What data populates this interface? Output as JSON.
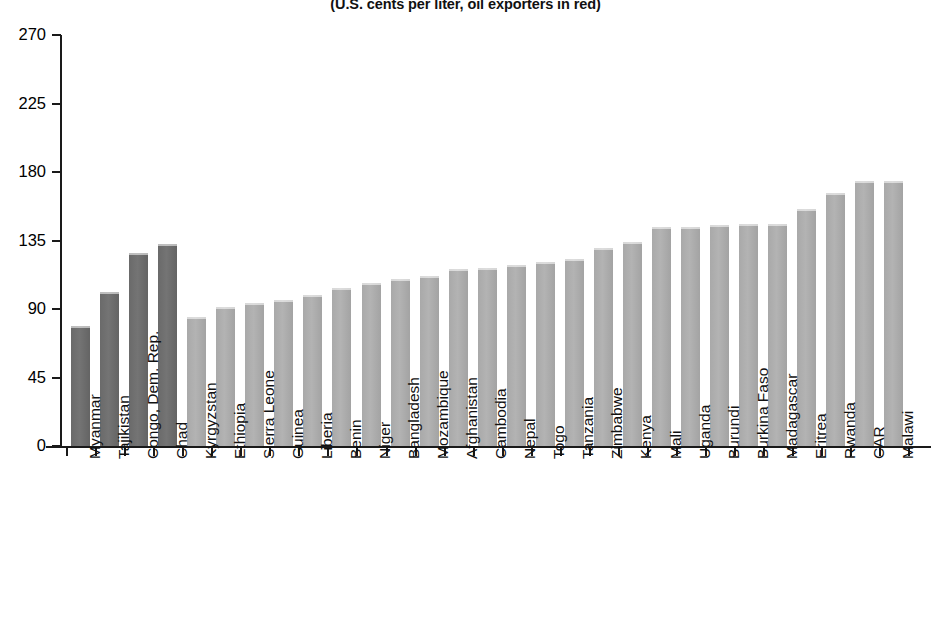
{
  "chart_data": {
    "type": "bar",
    "title": "(U.S. cents per liter, oil exporters in red)",
    "subtitle": "(U.S. cents per liter, oil exporters in red)",
    "xlabel": "",
    "ylabel": "",
    "ylim": [
      0,
      270
    ],
    "yticks": [
      0,
      45,
      90,
      135,
      180,
      225,
      270
    ],
    "ytick_labels": [
      "0",
      "45",
      "90",
      "135",
      "180",
      "225",
      "270"
    ],
    "grid": false,
    "legend": "none",
    "categories": [
      "Myanmar",
      "Tajikistan",
      "Congo, Dem. Rep.",
      "Chad",
      "Kyrgyzstan",
      "Ethiopia",
      "Sierra Leone",
      "Guinea",
      "Liberia",
      "Benin",
      "Niger",
      "Bangladesh",
      "Mozambique",
      "Afghanistan",
      "Cambodia",
      "Nepal",
      "Togo",
      "Tanzania",
      "Zimbabwe",
      "Kenya",
      "Mali",
      "Uganda",
      "Burundi",
      "Burkina Faso",
      "Madagascar",
      "Eritrea",
      "Rwanda",
      "CAR",
      "Malawi"
    ],
    "values": [
      79,
      101,
      127,
      133,
      85,
      91,
      94,
      96,
      99,
      104,
      107,
      110,
      112,
      116,
      117,
      119,
      121,
      123,
      130,
      134,
      144,
      144,
      145,
      146,
      146,
      156,
      166,
      174,
      174
    ],
    "highlighted_indices": [
      0,
      1,
      2,
      3
    ],
    "highlight_note": "oil exporters in red",
    "colors": {
      "bar_default": "#a9a9a9",
      "bar_highlight": "#6a6a6a",
      "axis": "#1a1a1a",
      "text": "#111111",
      "background": "#ffffff"
    }
  }
}
